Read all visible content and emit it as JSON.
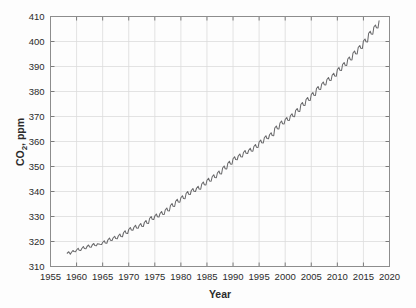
{
  "figure": {
    "background_color": "#fdfdfd",
    "plot_border_color": "#8d8d8d",
    "grid_color": "#dcdcdc",
    "line_color": "#69696b"
  },
  "axis_titles": {
    "x": "Year",
    "y": "CO2, ppm",
    "y_parts": {
      "prefix": "CO",
      "subscript": "2",
      "suffix": ", ppm"
    }
  },
  "chart_data": {
    "type": "line",
    "title": "",
    "xlabel": "Year",
    "ylabel": "CO2, ppm",
    "xlim": [
      1955,
      2020
    ],
    "ylim": [
      310,
      410
    ],
    "xticks": [
      1955,
      1960,
      1965,
      1970,
      1975,
      1980,
      1985,
      1990,
      1995,
      2000,
      2005,
      2010,
      2015,
      2020
    ],
    "yticks": [
      310,
      320,
      330,
      340,
      350,
      360,
      370,
      380,
      390,
      400,
      410
    ],
    "grid": true,
    "legend": "none",
    "series": [
      {
        "name": "Atmospheric CO2 concentration",
        "x": [
          1958.2,
          1958.5,
          1958.8,
          1959.0,
          1959.3,
          1959.5,
          1959.8,
          1960.0,
          1960.3,
          1960.5,
          1960.8,
          1961.0,
          1961.3,
          1961.5,
          1961.8,
          1962.0,
          1962.3,
          1962.5,
          1962.8,
          1963.0,
          1963.3,
          1963.5,
          1963.8,
          1964.0,
          1964.5,
          1964.8,
          1965.0,
          1965.3,
          1965.5,
          1965.8,
          1966.0,
          1966.3,
          1966.5,
          1966.8,
          1967.0,
          1967.3,
          1967.5,
          1967.8,
          1968.0,
          1968.3,
          1968.5,
          1968.8,
          1969.0,
          1969.3,
          1969.5,
          1969.8,
          1970.0,
          1970.3,
          1970.5,
          1970.8,
          1971.0,
          1971.3,
          1971.5,
          1971.8,
          1972.0,
          1972.3,
          1972.5,
          1972.8,
          1973.0,
          1973.3,
          1973.5,
          1973.8,
          1974.0,
          1974.3,
          1974.5,
          1974.8,
          1975.0,
          1975.3,
          1975.5,
          1975.8,
          1976.0,
          1976.3,
          1976.5,
          1976.8,
          1977.0,
          1977.3,
          1977.5,
          1977.8,
          1978.0,
          1978.3,
          1978.5,
          1978.8,
          1979.0,
          1979.3,
          1979.5,
          1979.8,
          1980.0,
          1980.3,
          1980.5,
          1980.8,
          1981.0,
          1981.3,
          1981.5,
          1981.8,
          1982.0,
          1982.3,
          1982.5,
          1982.8,
          1983.0,
          1983.3,
          1983.5,
          1983.8,
          1984.0,
          1984.3,
          1984.5,
          1984.8,
          1985.0,
          1985.3,
          1985.5,
          1985.8,
          1986.0,
          1986.3,
          1986.5,
          1986.8,
          1987.0,
          1987.3,
          1987.5,
          1987.8,
          1988.0,
          1988.3,
          1988.5,
          1988.8,
          1989.0,
          1989.3,
          1989.5,
          1989.8,
          1990.0,
          1990.3,
          1990.5,
          1990.8,
          1991.0,
          1991.3,
          1991.5,
          1991.8,
          1992.0,
          1992.3,
          1992.5,
          1992.8,
          1993.0,
          1993.3,
          1993.5,
          1993.8,
          1994.0,
          1994.3,
          1994.5,
          1994.8,
          1995.0,
          1995.3,
          1995.5,
          1995.8,
          1996.0,
          1996.3,
          1996.5,
          1996.8,
          1997.0,
          1997.3,
          1997.5,
          1997.8,
          1998.0,
          1998.3,
          1998.5,
          1998.8,
          1999.0,
          1999.3,
          1999.5,
          1999.8,
          2000.0,
          2000.3,
          2000.5,
          2000.8,
          2001.0,
          2001.3,
          2001.5,
          2001.8,
          2002.0,
          2002.3,
          2002.5,
          2002.8,
          2003.0,
          2003.3,
          2003.5,
          2003.8,
          2004.0,
          2004.3,
          2004.5,
          2004.8,
          2005.0,
          2005.3,
          2005.5,
          2005.8,
          2006.0,
          2006.3,
          2006.5,
          2006.8,
          2007.0,
          2007.3,
          2007.5,
          2007.8,
          2008.0,
          2008.3,
          2008.5,
          2008.8,
          2009.0,
          2009.3,
          2009.5,
          2009.8,
          2010.0,
          2010.3,
          2010.5,
          2010.8,
          2011.0,
          2011.3,
          2011.5,
          2011.8,
          2012.0,
          2012.3,
          2012.5,
          2012.8,
          2013.0,
          2013.3,
          2013.5,
          2013.8,
          2014.0,
          2014.3,
          2014.5,
          2014.8,
          2015.0,
          2015.3,
          2015.5,
          2015.8,
          2016.0,
          2016.3,
          2016.5,
          2016.8,
          2017.0,
          2017.3,
          2017.5,
          2017.8,
          2018.0
        ],
        "y": [
          315.3,
          315.9,
          314.9,
          315.6,
          316.4,
          316.0,
          315.9,
          316.6,
          317.3,
          316.5,
          316.4,
          317.2,
          318.0,
          317.2,
          317.1,
          318.0,
          318.6,
          317.8,
          317.7,
          318.6,
          319.2,
          318.4,
          318.3,
          319.1,
          318.9,
          318.8,
          319.6,
          320.3,
          319.4,
          319.3,
          320.6,
          321.4,
          320.5,
          320.4,
          321.4,
          322.1,
          321.2,
          321.1,
          322.2,
          323.0,
          322.0,
          321.9,
          323.5,
          324.3,
          323.3,
          323.2,
          324.8,
          325.6,
          324.6,
          324.5,
          325.7,
          326.5,
          325.4,
          325.3,
          326.4,
          327.2,
          326.1,
          326.0,
          327.6,
          328.4,
          327.3,
          327.2,
          329.2,
          330.0,
          328.9,
          328.8,
          330.2,
          331.0,
          329.9,
          329.8,
          331.2,
          332.0,
          330.9,
          330.8,
          332.6,
          333.4,
          332.3,
          332.2,
          334.4,
          335.2,
          334.1,
          334.0,
          336.1,
          336.9,
          335.8,
          335.7,
          337.5,
          338.3,
          337.2,
          337.1,
          339.2,
          340.0,
          338.9,
          338.8,
          340.4,
          341.2,
          340.1,
          340.0,
          341.3,
          342.1,
          341.0,
          340.9,
          343.0,
          343.8,
          342.7,
          342.6,
          344.5,
          345.3,
          344.2,
          344.1,
          345.9,
          346.7,
          345.6,
          345.5,
          347.4,
          348.2,
          347.1,
          347.0,
          349.4,
          350.2,
          349.1,
          349.0,
          351.3,
          352.1,
          351.0,
          350.9,
          353.1,
          353.9,
          352.8,
          352.7,
          354.2,
          355.0,
          353.9,
          353.8,
          355.6,
          356.4,
          355.3,
          355.2,
          356.5,
          357.3,
          356.2,
          356.1,
          358.0,
          358.8,
          357.7,
          357.6,
          359.8,
          360.6,
          359.5,
          359.4,
          361.5,
          362.3,
          361.2,
          361.1,
          362.7,
          363.5,
          362.4,
          362.3,
          365.4,
          366.2,
          365.1,
          365.0,
          367.4,
          368.2,
          367.1,
          367.0,
          368.8,
          369.6,
          368.5,
          368.4,
          370.3,
          371.1,
          370.0,
          369.9,
          372.4,
          373.2,
          372.1,
          372.0,
          374.8,
          375.6,
          374.5,
          374.4,
          376.8,
          377.6,
          376.5,
          376.4,
          378.8,
          379.6,
          378.5,
          378.4,
          381.2,
          382.0,
          380.9,
          380.8,
          383.0,
          383.8,
          382.7,
          382.6,
          384.8,
          385.6,
          384.5,
          384.4,
          386.5,
          387.3,
          386.2,
          386.1,
          388.8,
          389.6,
          388.5,
          388.4,
          390.8,
          391.6,
          390.5,
          390.4,
          393.0,
          393.8,
          392.7,
          392.6,
          395.4,
          396.2,
          395.1,
          395.0,
          397.6,
          398.4,
          397.3,
          397.2,
          400.2,
          401.0,
          399.9,
          399.8,
          403.3,
          404.1,
          403.0,
          402.9,
          405.8,
          406.6,
          405.5,
          405.4,
          408.3
        ]
      }
    ]
  }
}
